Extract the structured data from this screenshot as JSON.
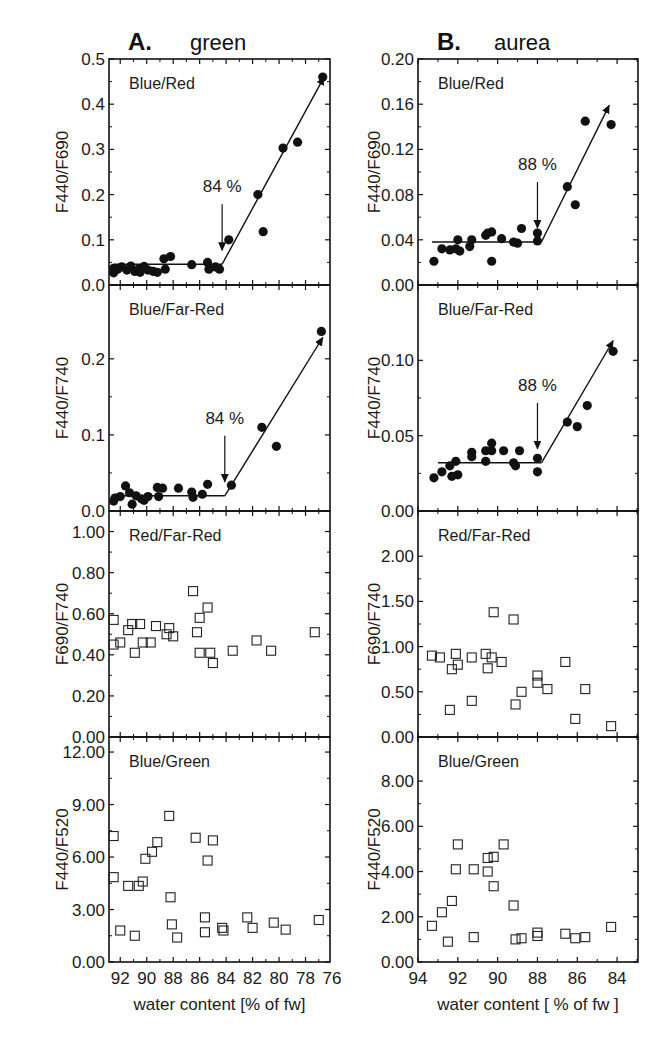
{
  "chart_data": [
    {
      "type": "scatter",
      "column": "A",
      "column_title_letter": "A.",
      "column_title": "green",
      "panel_label": "Blue/Red",
      "ylabel": "F440/F690",
      "xlabel": "",
      "xlim": [
        92.85,
        76.15
      ],
      "ylim": [
        0,
        0.5
      ],
      "yticks": [
        0.0,
        0.1,
        0.2,
        0.3,
        0.4,
        0.5
      ],
      "ytick_labels": [
        "0.0",
        "0.1",
        "0.2",
        "0.3",
        "0.4",
        "0.5"
      ],
      "marker": "filled-circle",
      "annotation": {
        "text": "84 %",
        "x": 84.3
      },
      "fit": {
        "plateau": {
          "x": [
            92.5,
            84.3
          ],
          "y": 0.046
        },
        "slope_end": {
          "x": 76.6,
          "y": 0.46
        }
      },
      "points": [
        [
          92.5,
          0.027
        ],
        [
          92.5,
          0.037
        ],
        [
          92.2,
          0.035
        ],
        [
          91.9,
          0.04
        ],
        [
          91.5,
          0.033
        ],
        [
          91.2,
          0.042
        ],
        [
          90.9,
          0.03
        ],
        [
          90.6,
          0.035
        ],
        [
          90.5,
          0.028
        ],
        [
          90.2,
          0.041
        ],
        [
          89.9,
          0.033
        ],
        [
          89.5,
          0.03
        ],
        [
          89.2,
          0.028
        ],
        [
          88.7,
          0.058
        ],
        [
          88.6,
          0.035
        ],
        [
          88.2,
          0.063
        ],
        [
          86.6,
          0.045
        ],
        [
          85.4,
          0.05
        ],
        [
          85.3,
          0.035
        ],
        [
          84.8,
          0.04
        ],
        [
          84.5,
          0.035
        ],
        [
          83.8,
          0.1
        ],
        [
          81.6,
          0.2
        ],
        [
          81.2,
          0.118
        ],
        [
          79.7,
          0.303
        ],
        [
          78.6,
          0.316
        ],
        [
          76.7,
          0.46
        ]
      ]
    },
    {
      "type": "scatter",
      "column": "A",
      "panel_label": "Blue/Far-Red",
      "ylabel": "F440/F740",
      "xlabel": "",
      "xlim": [
        92.85,
        76.15
      ],
      "ylim": [
        0,
        0.297
      ],
      "yticks": [
        0.0,
        0.1,
        0.2
      ],
      "ytick_labels": [
        "0.0",
        "0.1",
        "0.2"
      ],
      "marker": "filled-circle",
      "annotation": {
        "text": "84 %",
        "x": 84.1
      },
      "fit": {
        "plateau": {
          "x": [
            92.5,
            84.1
          ],
          "y": 0.02
        },
        "slope_end": {
          "x": 76.7,
          "y": 0.228
        }
      },
      "points": [
        [
          92.5,
          0.013
        ],
        [
          92.4,
          0.017
        ],
        [
          92.0,
          0.019
        ],
        [
          91.6,
          0.033
        ],
        [
          91.3,
          0.024
        ],
        [
          91.1,
          0.009
        ],
        [
          90.8,
          0.02
        ],
        [
          90.4,
          0.016
        ],
        [
          90.2,
          0.014
        ],
        [
          89.9,
          0.019
        ],
        [
          89.2,
          0.031
        ],
        [
          89.1,
          0.019
        ],
        [
          88.8,
          0.03
        ],
        [
          87.6,
          0.03
        ],
        [
          86.6,
          0.025
        ],
        [
          86.5,
          0.018
        ],
        [
          85.8,
          0.022
        ],
        [
          85.4,
          0.035
        ],
        [
          83.6,
          0.034
        ],
        [
          81.3,
          0.11
        ],
        [
          80.2,
          0.085
        ],
        [
          76.8,
          0.236
        ]
      ]
    },
    {
      "type": "scatter",
      "column": "A",
      "panel_label": "Red/Far-Red",
      "ylabel": "F690/F740",
      "xlabel": "",
      "xlim": [
        92.85,
        76.15
      ],
      "ylim": [
        0,
        1.1
      ],
      "yticks": [
        0,
        0.2,
        0.4,
        0.6,
        0.8,
        1.0
      ],
      "ytick_labels": [
        "0.00",
        "0.20",
        "0.40",
        "0.60",
        "0.80",
        "1.00"
      ],
      "marker": "open-square",
      "points": [
        [
          92.5,
          0.57
        ],
        [
          92.5,
          0.45
        ],
        [
          92.0,
          0.46
        ],
        [
          91.4,
          0.52
        ],
        [
          91.1,
          0.55
        ],
        [
          90.9,
          0.41
        ],
        [
          90.5,
          0.55
        ],
        [
          90.3,
          0.46
        ],
        [
          89.7,
          0.46
        ],
        [
          89.3,
          0.54
        ],
        [
          88.5,
          0.5
        ],
        [
          88.3,
          0.53
        ],
        [
          88.0,
          0.49
        ],
        [
          86.5,
          0.71
        ],
        [
          86.2,
          0.51
        ],
        [
          86.0,
          0.58
        ],
        [
          86.0,
          0.41
        ],
        [
          85.4,
          0.63
        ],
        [
          85.2,
          0.41
        ],
        [
          85.0,
          0.36
        ],
        [
          83.5,
          0.42
        ],
        [
          81.7,
          0.47
        ],
        [
          80.6,
          0.42
        ],
        [
          77.3,
          0.51
        ]
      ]
    },
    {
      "type": "scatter",
      "column": "A",
      "panel_label": "Blue/Green",
      "ylabel": "F440/F520",
      "xlabel": "water content [% of fw]",
      "xlim": [
        92.85,
        76.15
      ],
      "ylim": [
        0,
        12.86
      ],
      "yticks": [
        0,
        3,
        6,
        9,
        12
      ],
      "ytick_labels": [
        "0.00",
        "3.00",
        "6.00",
        "9.00",
        "12.00"
      ],
      "xticks": [
        92,
        90,
        88,
        86,
        84,
        82,
        80,
        78,
        76
      ],
      "xtick_labels": [
        "92",
        "90",
        "88",
        "86",
        "84",
        "82",
        "80",
        "78",
        "76"
      ],
      "marker": "open-square",
      "points": [
        [
          92.5,
          7.2
        ],
        [
          92.5,
          4.85
        ],
        [
          92.0,
          1.8
        ],
        [
          91.4,
          4.35
        ],
        [
          90.9,
          1.5
        ],
        [
          90.6,
          4.35
        ],
        [
          90.3,
          4.6
        ],
        [
          90.1,
          5.9
        ],
        [
          89.6,
          6.3
        ],
        [
          89.2,
          6.85
        ],
        [
          88.3,
          8.35
        ],
        [
          88.2,
          3.7
        ],
        [
          88.1,
          2.15
        ],
        [
          87.7,
          1.4
        ],
        [
          86.3,
          7.1
        ],
        [
          85.6,
          2.55
        ],
        [
          85.6,
          1.7
        ],
        [
          85.4,
          5.8
        ],
        [
          85.0,
          6.95
        ],
        [
          84.3,
          1.95
        ],
        [
          84.2,
          1.8
        ],
        [
          82.4,
          2.55
        ],
        [
          82.0,
          1.95
        ],
        [
          80.4,
          2.25
        ],
        [
          79.5,
          1.85
        ],
        [
          77.0,
          2.4
        ]
      ]
    },
    {
      "type": "scatter",
      "column": "B",
      "column_title_letter": "B.",
      "column_title": "aurea",
      "panel_label": "Blue/Red",
      "ylabel": "F440/F690",
      "xlabel": "",
      "xlim": [
        94,
        82.95
      ],
      "ylim": [
        0,
        0.2
      ],
      "yticks": [
        0,
        0.04,
        0.08,
        0.12,
        0.16,
        0.2
      ],
      "ytick_labels": [
        "0.00",
        "0.04",
        "0.08",
        "0.12",
        "0.16",
        "0.20"
      ],
      "marker": "filled-circle",
      "annotation": {
        "text": "88 %",
        "x": 88.0
      },
      "fit": {
        "plateau": {
          "x": [
            93.3,
            87.8
          ],
          "y": 0.038
        },
        "slope_end": {
          "x": 84.4,
          "y": 0.159
        }
      },
      "points": [
        [
          93.2,
          0.021
        ],
        [
          92.8,
          0.032
        ],
        [
          92.4,
          0.031
        ],
        [
          92.1,
          0.032
        ],
        [
          92.0,
          0.04
        ],
        [
          91.9,
          0.03
        ],
        [
          91.4,
          0.034
        ],
        [
          91.3,
          0.04
        ],
        [
          90.6,
          0.044
        ],
        [
          90.5,
          0.046
        ],
        [
          90.3,
          0.047
        ],
        [
          90.3,
          0.021
        ],
        [
          89.8,
          0.041
        ],
        [
          89.2,
          0.038
        ],
        [
          89.0,
          0.037
        ],
        [
          88.8,
          0.05
        ],
        [
          88.0,
          0.046
        ],
        [
          88.0,
          0.039
        ],
        [
          86.5,
          0.087
        ],
        [
          86.1,
          0.071
        ],
        [
          85.6,
          0.145
        ],
        [
          84.3,
          0.142
        ]
      ]
    },
    {
      "type": "scatter",
      "column": "B",
      "panel_label": "Blue/Far-Red",
      "ylabel": "F440/F740",
      "xlabel": "",
      "xlim": [
        94,
        82.95
      ],
      "ylim": [
        0,
        0.15
      ],
      "yticks": [
        0,
        0.05,
        0.1
      ],
      "ytick_labels": [
        "0.00",
        "0.05",
        "0.10"
      ],
      "marker": "filled-circle",
      "annotation": {
        "text": "88 %",
        "x": 88.0
      },
      "fit": {
        "plateau": {
          "x": [
            93.0,
            87.8
          ],
          "y": 0.032
        },
        "slope_end": {
          "x": 84.2,
          "y": 0.113
        }
      },
      "points": [
        [
          93.2,
          0.022
        ],
        [
          92.8,
          0.026
        ],
        [
          92.4,
          0.03
        ],
        [
          92.3,
          0.023
        ],
        [
          92.1,
          0.033
        ],
        [
          92.0,
          0.024
        ],
        [
          91.3,
          0.039
        ],
        [
          91.3,
          0.036
        ],
        [
          90.6,
          0.04
        ],
        [
          90.6,
          0.033
        ],
        [
          90.3,
          0.045
        ],
        [
          90.3,
          0.04
        ],
        [
          89.7,
          0.04
        ],
        [
          89.2,
          0.032
        ],
        [
          89.1,
          0.03
        ],
        [
          88.9,
          0.04
        ],
        [
          88.0,
          0.035
        ],
        [
          88.0,
          0.026
        ],
        [
          86.5,
          0.059
        ],
        [
          86.0,
          0.056
        ],
        [
          85.5,
          0.07
        ],
        [
          84.2,
          0.106
        ]
      ]
    },
    {
      "type": "scatter",
      "column": "B",
      "panel_label": "Red/Far-Red",
      "ylabel": "F690/F740",
      "xlabel": "",
      "xlim": [
        94,
        82.95
      ],
      "ylim": [
        0,
        2.5
      ],
      "yticks": [
        0,
        0.5,
        1.0,
        1.5,
        2.0
      ],
      "ytick_labels": [
        "0.00",
        "0.50",
        "1.00",
        "1.50",
        "2.00"
      ],
      "marker": "open-square",
      "points": [
        [
          93.3,
          0.9
        ],
        [
          92.9,
          0.88
        ],
        [
          92.4,
          0.3
        ],
        [
          92.3,
          0.75
        ],
        [
          92.1,
          0.92
        ],
        [
          92.0,
          0.8
        ],
        [
          91.3,
          0.88
        ],
        [
          91.3,
          0.4
        ],
        [
          90.6,
          0.92
        ],
        [
          90.5,
          0.76
        ],
        [
          90.3,
          0.88
        ],
        [
          90.2,
          1.38
        ],
        [
          89.8,
          0.83
        ],
        [
          89.2,
          1.3
        ],
        [
          89.1,
          0.36
        ],
        [
          88.8,
          0.5
        ],
        [
          88.0,
          0.68
        ],
        [
          88.0,
          0.6
        ],
        [
          87.5,
          0.53
        ],
        [
          86.6,
          0.83
        ],
        [
          86.1,
          0.2
        ],
        [
          85.6,
          0.53
        ],
        [
          84.3,
          0.12
        ]
      ]
    },
    {
      "type": "scatter",
      "column": "B",
      "panel_label": "Blue/Green",
      "ylabel": "F440/F520",
      "xlabel": "water content [ % of fw ]",
      "xlim": [
        94,
        82.95
      ],
      "ylim": [
        0,
        9.95
      ],
      "yticks": [
        0,
        2,
        4,
        6,
        8
      ],
      "ytick_labels": [
        "0.00",
        "2.00",
        "4.00",
        "6.00",
        "8.00"
      ],
      "xticks": [
        94,
        92,
        90,
        88,
        86,
        84
      ],
      "xtick_labels": [
        "94",
        "92",
        "90",
        "88",
        "86",
        "84"
      ],
      "marker": "open-square",
      "points": [
        [
          93.3,
          1.6
        ],
        [
          92.8,
          2.2
        ],
        [
          92.5,
          0.9
        ],
        [
          92.3,
          2.7
        ],
        [
          92.1,
          4.1
        ],
        [
          92.0,
          5.2
        ],
        [
          91.2,
          4.1
        ],
        [
          91.2,
          1.1
        ],
        [
          90.5,
          4.0
        ],
        [
          90.5,
          4.6
        ],
        [
          90.2,
          4.65
        ],
        [
          90.2,
          3.35
        ],
        [
          89.7,
          5.2
        ],
        [
          89.2,
          2.5
        ],
        [
          89.1,
          1.0
        ],
        [
          88.8,
          1.05
        ],
        [
          88.0,
          1.3
        ],
        [
          88.0,
          1.15
        ],
        [
          86.6,
          1.25
        ],
        [
          86.1,
          1.05
        ],
        [
          85.6,
          1.1
        ],
        [
          84.3,
          1.55
        ]
      ]
    }
  ]
}
